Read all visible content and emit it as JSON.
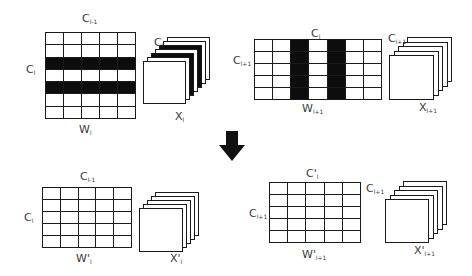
{
  "diagram": {
    "type": "channel-pruning-illustration",
    "top_left": {
      "grid": {
        "rows": 7,
        "cols": 5,
        "dark_rows": [
          2,
          4
        ],
        "dark_cols": []
      },
      "stack": {
        "layers": 7,
        "dark_layers": [
          2,
          4
        ]
      },
      "labels": {
        "top": {
          "main": "C",
          "sub": "l-1"
        },
        "left": {
          "main": "C",
          "sub": "l"
        },
        "bottom": {
          "main": "W",
          "sub": "l"
        },
        "stack_top": {
          "main": "C",
          "sub": "l"
        },
        "stack_bottom": {
          "main": "X",
          "sub": "l"
        }
      }
    },
    "top_right": {
      "grid": {
        "rows": 5,
        "cols": 7,
        "dark_rows": [],
        "dark_cols": [
          2,
          4
        ]
      },
      "stack": {
        "layers": 5,
        "dark_layers": []
      },
      "labels": {
        "top": {
          "main": "C",
          "sub": "l"
        },
        "left": {
          "main": "C",
          "sub": "l+1"
        },
        "bottom": {
          "main": "W",
          "sub": "l+1"
        },
        "stack_top": {
          "main": "C",
          "sub": "l+1"
        },
        "stack_bottom": {
          "main": "X",
          "sub": "l+1"
        }
      }
    },
    "arrow": {
      "direction": "down",
      "color": "#111111"
    },
    "bottom_left": {
      "grid": {
        "rows": 5,
        "cols": 5,
        "dark_rows": [],
        "dark_cols": []
      },
      "stack": {
        "layers": 5,
        "dark_layers": []
      },
      "labels": {
        "top": {
          "main": "C",
          "sub": "l-1"
        },
        "left": {
          "main": "C",
          "sub": "l"
        },
        "bottom": {
          "main": "W'",
          "sub": "l"
        },
        "stack_bottom": {
          "main": "X'",
          "sub": "l"
        }
      }
    },
    "bottom_right": {
      "grid": {
        "rows": 5,
        "cols": 5,
        "dark_rows": [],
        "dark_cols": []
      },
      "stack": {
        "layers": 5,
        "dark_layers": []
      },
      "labels": {
        "top": {
          "main": "C'",
          "sub": "l"
        },
        "left": {
          "main": "C",
          "sub": "l+1"
        },
        "bottom": {
          "main": "W'",
          "sub": "l+1"
        },
        "stack_top": {
          "main": "C",
          "sub": "l+1"
        },
        "stack_bottom": {
          "main": "X'",
          "sub": "l+1"
        }
      }
    }
  }
}
